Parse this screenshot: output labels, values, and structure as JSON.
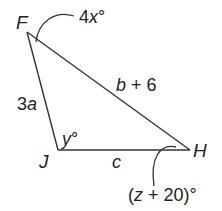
{
  "diagram": {
    "type": "triangle",
    "colors": {
      "stroke": "#333333",
      "text": "#222222",
      "background": "#ffffff"
    },
    "vertices": {
      "F": {
        "label": "F"
      },
      "J": {
        "label": "J"
      },
      "H": {
        "label": "H"
      }
    },
    "sides": {
      "FJ": {
        "label_var": "3",
        "label_it": "a"
      },
      "FH": {
        "label_var": "b",
        "label_rest": " + 6"
      },
      "JH": {
        "label_it": "c"
      }
    },
    "angles": {
      "F": {
        "pre": "4",
        "var": "x",
        "post": "°"
      },
      "J": {
        "var": "y",
        "post": "°"
      },
      "H": {
        "pre": "(",
        "var": "z",
        "post": " + 20)°"
      }
    }
  }
}
